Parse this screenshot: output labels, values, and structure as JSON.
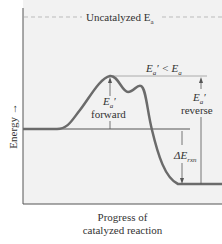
{
  "diagram": {
    "y_axis_label": "Energy",
    "x_axis_label_line1": "Progress of",
    "x_axis_label_line2": "catalyzed reaction",
    "uncatalyzed_label": "Uncatalyzed E",
    "uncatalyzed_sub": "a",
    "comparison_label": "E",
    "comparison_sub": "a",
    "comparison_rest": "′ < E",
    "comparison_sub2": "a",
    "forward_ea": "E",
    "forward_ea_sub": "a",
    "forward_ea_prime": "′",
    "forward_label": "forward",
    "reverse_ea": "E",
    "reverse_ea_sub": "a",
    "reverse_ea_prime": "′",
    "reverse_label": "reverse",
    "delta_label": "ΔE",
    "delta_sub": "rxn",
    "colors": {
      "curve": "#6b6b6b",
      "background": "#f2f2f2",
      "dashed": "#bbbbbb",
      "lines": "#555555"
    }
  }
}
